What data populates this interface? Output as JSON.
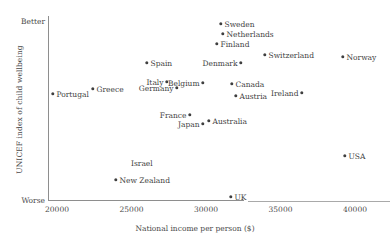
{
  "chart_data": {
    "type": "scatter",
    "title": "",
    "xlabel": "National income per person ($)",
    "ylabel": "UNICEF index of child wellbeing",
    "y_axis_endpoints": {
      "top": "Better",
      "bottom": "Worse"
    },
    "xlim": [
      18500,
      43500
    ],
    "xticks": [
      20000,
      25000,
      30000,
      35000,
      40000
    ],
    "xtick_labels": [
      "20000",
      "25000",
      "30000",
      "35000",
      "40000"
    ],
    "grid": false,
    "legend": false,
    "y_axis_units": "index (unlabeled, higher is better)",
    "points": [
      {
        "label": "Portugal",
        "x": 19800,
        "y": 0.575,
        "px": 53,
        "py": 94,
        "label_side": "right"
      },
      {
        "label": "Greece",
        "x": 22500,
        "y": 0.603,
        "px": 93,
        "py": 89,
        "label_side": "right"
      },
      {
        "label": "New Zealand",
        "x": 24050,
        "y": 0.109,
        "px": 116,
        "py": 180,
        "label_side": "right"
      },
      {
        "label": "Israel",
        "x": 26000,
        "y": 0.2,
        "px": 143,
        "py": 163,
        "label_side": "none"
      },
      {
        "label": "Spain",
        "x": 25600,
        "y": 0.772,
        "px": 147,
        "py": 63,
        "label_side": "right"
      },
      {
        "label": "Italy",
        "x": 27000,
        "y": 0.669,
        "px": 167,
        "py": 82,
        "label_side": "left"
      },
      {
        "label": "Germany",
        "x": 27700,
        "y": 0.636,
        "px": 177,
        "py": 88,
        "label_side": "left"
      },
      {
        "label": "France",
        "x": 28550,
        "y": 0.489,
        "px": 190,
        "py": 115,
        "label_side": "left"
      },
      {
        "label": "Belgium",
        "x": 29400,
        "y": 0.664,
        "px": 203,
        "py": 83,
        "label_side": "left"
      },
      {
        "label": "Japan",
        "x": 29400,
        "y": 0.441,
        "px": 203,
        "py": 124,
        "label_side": "left"
      },
      {
        "label": "Australia",
        "x": 29800,
        "y": 0.457,
        "px": 209,
        "py": 121,
        "label_side": "right"
      },
      {
        "label": "Finland",
        "x": 30350,
        "y": 0.875,
        "px": 217,
        "py": 44,
        "label_side": "right"
      },
      {
        "label": "Sweden",
        "x": 30600,
        "y": 0.983,
        "px": 221,
        "py": 24,
        "label_side": "right"
      },
      {
        "label": "Netherlands",
        "x": 30750,
        "y": 0.929,
        "px": 223,
        "py": 34,
        "label_side": "right"
      },
      {
        "label": "UK",
        "x": 31300,
        "y": 0.016,
        "px": 231,
        "py": 197,
        "label_side": "right"
      },
      {
        "label": "Canada",
        "x": 31400,
        "y": 0.658,
        "px": 232,
        "py": 84,
        "label_side": "right"
      },
      {
        "label": "Austria",
        "x": 31650,
        "y": 0.593,
        "px": 236,
        "py": 96,
        "label_side": "right"
      },
      {
        "label": "Denmark",
        "x": 31950,
        "y": 0.815,
        "px": 241,
        "py": 63,
        "label_side": "left"
      },
      {
        "label": "Switzerland",
        "x": 33550,
        "y": 0.859,
        "px": 265,
        "py": 55,
        "label_side": "right"
      },
      {
        "label": "Ireland",
        "x": 36050,
        "y": 0.653,
        "px": 302,
        "py": 93,
        "label_side": "left"
      },
      {
        "label": "Norway",
        "x": 38800,
        "y": 0.848,
        "px": 343,
        "py": 57,
        "label_side": "right"
      },
      {
        "label": "USA",
        "x": 38950,
        "y": 0.311,
        "px": 345,
        "py": 156,
        "label_side": "right"
      }
    ]
  },
  "axis": {
    "x_title": "National income per person ($)",
    "y_title": "UNICEF index of child wellbeing",
    "y_top_label": "Better",
    "y_bottom_label": "Worse"
  }
}
